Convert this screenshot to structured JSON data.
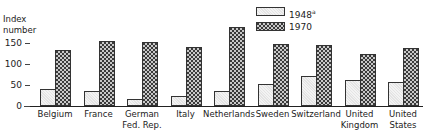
{
  "chart_data": {
    "type": "bar",
    "title": "",
    "xlabel": "",
    "ylabel": "Index number",
    "ylim": [
      0,
      200
    ],
    "yticks": [
      0,
      50,
      100,
      150
    ],
    "grid": false,
    "legend_position": "top-right",
    "categories": [
      "Belgium",
      "France",
      "German Fed. Rep.",
      "Italy",
      "Netherlands",
      "Sweden",
      "Switzerland",
      "United Kingdom",
      "United States"
    ],
    "category_lines": [
      [
        "Belgium"
      ],
      [
        "France"
      ],
      [
        "German",
        "Fed. Rep."
      ],
      [
        "Italy"
      ],
      [
        "Netherlands"
      ],
      [
        "Sweden"
      ],
      [
        "Switzerland"
      ],
      [
        "United",
        "Kingdom"
      ],
      [
        "United",
        "States"
      ]
    ],
    "series": [
      {
        "name": "1948",
        "legend_label": "1948 a",
        "style": "light",
        "values": [
          40,
          36,
          17,
          24,
          36,
          52,
          71,
          62,
          57
        ]
      },
      {
        "name": "1970",
        "legend_label": "1970",
        "style": "dark",
        "values": [
          133,
          155,
          152,
          140,
          188,
          148,
          145,
          124,
          138
        ]
      }
    ]
  },
  "labels": {
    "ylabel_line1": "Index",
    "ylabel_line2": "number",
    "legend_1948": "1948",
    "legend_1948_note": "a",
    "legend_1970": "1970"
  }
}
